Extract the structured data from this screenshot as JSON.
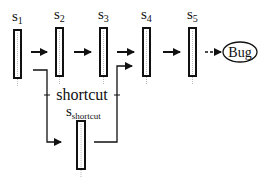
{
  "diagram": {
    "states": [
      {
        "id": "s1",
        "label": "s",
        "sub": "1"
      },
      {
        "id": "s2",
        "label": "s",
        "sub": "2"
      },
      {
        "id": "s3",
        "label": "s",
        "sub": "3"
      },
      {
        "id": "s4",
        "label": "s",
        "sub": "4"
      },
      {
        "id": "s5",
        "label": "s",
        "sub": "5"
      }
    ],
    "shortcut_state": {
      "label": "s",
      "sub": "shortcut"
    },
    "shortcut_label": "shortcut",
    "bug_label": "Bug",
    "colors": {
      "stroke": "#111111",
      "fill": "#ffffff",
      "dots": "#bbbbbb"
    }
  }
}
